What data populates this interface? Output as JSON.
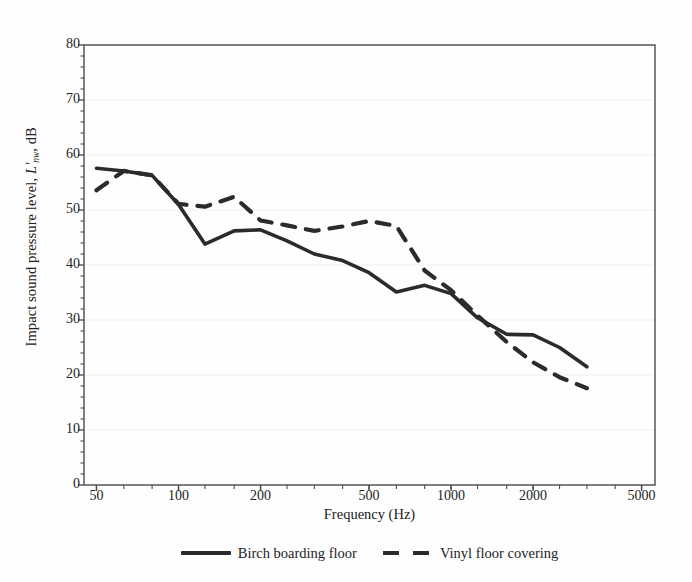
{
  "chart_data": {
    "type": "line",
    "title": "",
    "xlabel": "Frequency (Hz)",
    "ylabel_plain": "Impact sound pressure level, L'nw, dB",
    "ylabel_prefix": "Impact sound pressure level,",
    "ylabel_symbol": "L'",
    "ylabel_symbol_sub": "nw",
    "ylabel_suffix": ", dB",
    "xscale": "log",
    "xlim": [
      45,
      5600
    ],
    "ylim": [
      0,
      80
    ],
    "xticks": [
      50,
      100,
      200,
      500,
      1000,
      2000,
      5000
    ],
    "xtick_labels": [
      "50",
      "100",
      "200",
      "500",
      "1000",
      "2000",
      "5000"
    ],
    "yticks": [
      0,
      10,
      20,
      30,
      40,
      50,
      60,
      70,
      80
    ],
    "ytick_labels": [
      "0",
      "10",
      "20",
      "30",
      "40",
      "50",
      "60",
      "70",
      "80"
    ],
    "y_minor_step": 2,
    "grid": false,
    "legend_position": "below",
    "line_color": "#2b2b2b",
    "axis_color": "#4a4a4a",
    "series": [
      {
        "name": "Birch boarding floor",
        "style": "solid",
        "x": [
          50,
          63,
          80,
          100,
          125,
          160,
          200,
          250,
          315,
          400,
          500,
          630,
          800,
          1000,
          1250,
          1600,
          2000,
          2500,
          3150
        ],
        "y": [
          57.6,
          57.1,
          56.3,
          51.0,
          43.8,
          46.2,
          46.4,
          44.4,
          42.0,
          40.8,
          38.6,
          35.1,
          36.3,
          34.8,
          30.4,
          27.4,
          27.3,
          25.0,
          21.5
        ]
      },
      {
        "name": "Vinyl floor covering",
        "style": "dashed",
        "x": [
          50,
          63,
          80,
          100,
          125,
          160,
          200,
          250,
          315,
          400,
          500,
          630,
          800,
          1000,
          1250,
          1600,
          2000,
          2500,
          3150
        ],
        "y": [
          53.6,
          57.1,
          56.3,
          51.1,
          50.6,
          52.4,
          48.1,
          47.2,
          46.2,
          47.0,
          48.0,
          47.1,
          39.0,
          35.4,
          30.8,
          26.0,
          22.3,
          19.6,
          17.6
        ]
      }
    ]
  },
  "legend": {
    "entries": [
      {
        "label": "Birch boarding floor",
        "style": "solid"
      },
      {
        "label": "Vinyl floor covering",
        "style": "dashed"
      }
    ]
  }
}
